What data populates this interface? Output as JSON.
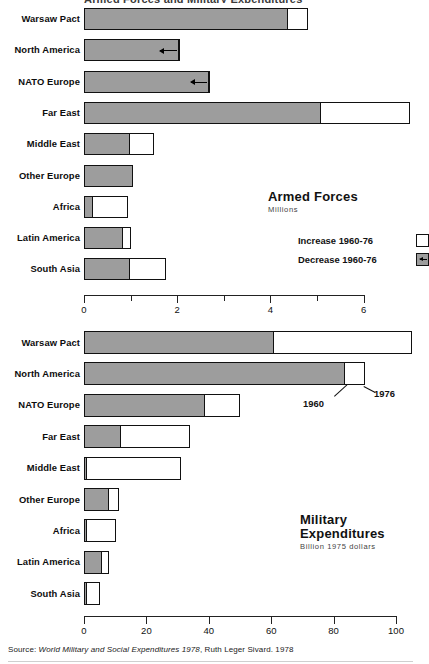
{
  "top_partial_title": "Armed Forces and Military Expenditures",
  "source": {
    "prefix": "Source:",
    "italic": "World Military and Social Expenditures 1978",
    "suffix": ", Ruth Leger Sivard. 1978"
  },
  "captions": {
    "armed_forces": {
      "title": "Armed Forces",
      "subtitle": "Millions",
      "legend": [
        {
          "label": "Increase 1960-76",
          "key": "increase-white-box"
        },
        {
          "label": "Decrease 1960-76",
          "key": "decrease-gray-arrow-box"
        }
      ]
    },
    "military_expenditures": {
      "title_line1": "Military",
      "title_line2": "Expenditures",
      "subtitle": "Billion 1975 dollars"
    }
  },
  "callouts": {
    "year_1960": "1960",
    "year_1976": "1976"
  },
  "colors": {
    "bar_1960_fill": "#9d9d9d",
    "bar_1976_fill": "#ffffff",
    "outline": "#111111",
    "background": "#ffffff"
  },
  "chart_data": [
    {
      "type": "bar",
      "id": "armed-forces",
      "title": "Armed Forces",
      "subtitle": "Millions",
      "orientation": "horizontal",
      "xlabel": "Millions",
      "ylabel": "",
      "xlim": [
        0,
        6.6
      ],
      "ticks": [
        0,
        1,
        2,
        3,
        4,
        5,
        6
      ],
      "tick_labels": [
        "0",
        "",
        "2",
        "",
        "4",
        "",
        "6"
      ],
      "grid": false,
      "legend": [
        "Increase 1960-76",
        "Decrease 1960-76"
      ],
      "categories": [
        "Warsaw Pact",
        "North America",
        "NATO Europe",
        "Far East",
        "Middle East",
        "Other Europe",
        "Africa",
        "Latin America",
        "South Asia"
      ],
      "series": [
        {
          "name": "1960",
          "values": [
            4.4,
            2.06,
            2.7,
            5.1,
            1.0,
            1.05,
            0.2,
            0.85,
            1.0
          ]
        },
        {
          "name": "1976",
          "values": [
            4.8,
            1.55,
            2.2,
            7.0,
            1.5,
            1.05,
            0.95,
            1.0,
            1.75
          ]
        }
      ],
      "change_direction": [
        "increase",
        "decrease",
        "decrease",
        "increase",
        "increase",
        "none",
        "increase",
        "increase",
        "increase"
      ]
    },
    {
      "type": "bar",
      "id": "military-expenditures",
      "title": "Military Expenditures",
      "subtitle": "Billion 1975 dollars",
      "orientation": "horizontal",
      "xlabel": "Billion 1975 dollars",
      "ylabel": "",
      "xlim": [
        0,
        107
      ],
      "ticks": [
        0,
        20,
        40,
        60,
        80,
        100
      ],
      "tick_labels": [
        "0",
        "20",
        "40",
        "60",
        "80",
        "100"
      ],
      "grid": false,
      "categories": [
        "Warsaw Pact",
        "North America",
        "NATO Europe",
        "Far East",
        "Middle East",
        "Other Europe",
        "Africa",
        "Latin America",
        "South Asia"
      ],
      "series": [
        {
          "name": "1960",
          "values": [
            61,
            84,
            39,
            12,
            1,
            8.3,
            0.5,
            6.1,
            1.0
          ]
        },
        {
          "name": "1976",
          "values": [
            105,
            90,
            50,
            34,
            31,
            11.2,
            10.3,
            8.0,
            5.0
          ]
        }
      ],
      "change_direction": [
        "increase",
        "increase",
        "increase",
        "increase",
        "increase",
        "increase",
        "increase",
        "increase",
        "increase"
      ]
    }
  ]
}
